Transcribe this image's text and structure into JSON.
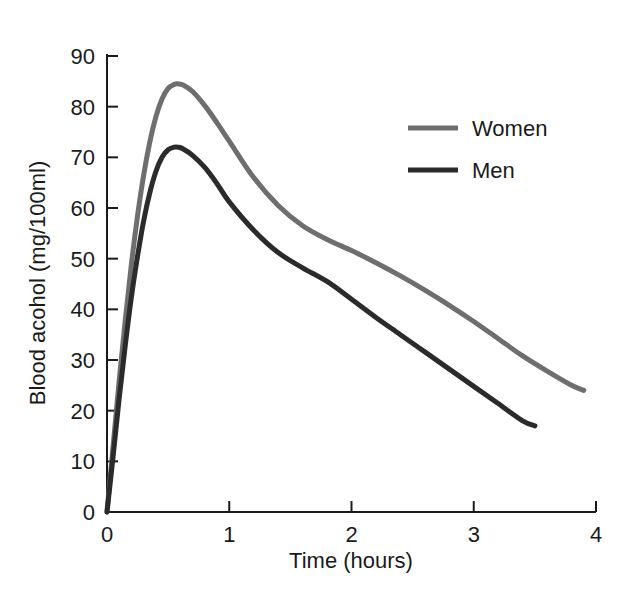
{
  "chart_data": {
    "type": "line",
    "title": "",
    "xlabel": "Time (hours)",
    "ylabel": "Blood acohol (mg/100ml)",
    "xlim": [
      0,
      4
    ],
    "ylim": [
      0,
      90
    ],
    "xticks": [
      "0",
      "1",
      "2",
      "3",
      "4"
    ],
    "xtick_values": [
      0,
      1,
      2,
      3,
      4
    ],
    "yticks": [
      "0",
      "10",
      "20",
      "30",
      "40",
      "50",
      "60",
      "70",
      "80",
      "90"
    ],
    "ytick_values": [
      0,
      10,
      20,
      30,
      40,
      50,
      60,
      70,
      80,
      90
    ],
    "grid": false,
    "legend_position": "upper right",
    "series": [
      {
        "name": "Women",
        "color": "#6e6e6e",
        "x": [
          0.0,
          0.05,
          0.1,
          0.15,
          0.2,
          0.25,
          0.3,
          0.35,
          0.4,
          0.45,
          0.5,
          0.55,
          0.58,
          0.62,
          0.7,
          0.8,
          0.9,
          1.0,
          1.2,
          1.4,
          1.6,
          1.8,
          2.0,
          2.2,
          2.4,
          2.6,
          2.8,
          3.0,
          3.2,
          3.4,
          3.6,
          3.8,
          3.9
        ],
        "y": [
          0.0,
          13.0,
          26.0,
          38.0,
          49.0,
          58.5,
          66.5,
          73.0,
          78.0,
          81.5,
          83.6,
          84.4,
          84.5,
          84.3,
          83.0,
          80.2,
          76.8,
          73.2,
          66.0,
          60.5,
          56.5,
          53.8,
          51.6,
          49.2,
          46.6,
          43.8,
          40.8,
          37.6,
          34.2,
          30.8,
          27.8,
          25.0,
          24.0
        ]
      },
      {
        "name": "Men",
        "color": "#2b2b2b",
        "x": [
          0.0,
          0.05,
          0.1,
          0.15,
          0.2,
          0.25,
          0.3,
          0.35,
          0.4,
          0.45,
          0.5,
          0.55,
          0.58,
          0.62,
          0.7,
          0.8,
          0.9,
          1.0,
          1.2,
          1.4,
          1.6,
          1.8,
          2.0,
          2.2,
          2.4,
          2.6,
          2.8,
          3.0,
          3.2,
          3.4,
          3.5
        ],
        "y": [
          0.0,
          11.0,
          22.5,
          33.0,
          42.5,
          50.5,
          57.5,
          63.0,
          67.2,
          70.0,
          71.5,
          72.0,
          72.0,
          71.7,
          70.4,
          68.0,
          64.8,
          61.2,
          55.6,
          51.2,
          48.2,
          45.5,
          42.0,
          38.4,
          35.0,
          31.6,
          28.2,
          24.8,
          21.4,
          18.0,
          17.0
        ]
      }
    ],
    "annotations": []
  },
  "legend": {
    "entries": [
      {
        "label": "Women",
        "color": "#6e6e6e"
      },
      {
        "label": "Men",
        "color": "#2b2b2b"
      }
    ]
  },
  "axes": {
    "x_title": "Time (hours)",
    "y_title": "Blood acohol (mg/100ml)"
  }
}
